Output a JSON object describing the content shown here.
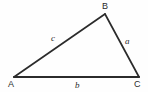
{
  "figure": {
    "type": "triangle-diagram",
    "background_color": "#fefefe",
    "stroke_color": "#2b2b2b",
    "text_color": "#2b2b2b",
    "vertices": [
      {
        "id": "A",
        "label": "A",
        "x": 14,
        "y": 77,
        "label_x": 8,
        "label_y": 80
      },
      {
        "id": "B",
        "label": "B",
        "x": 105,
        "y": 14,
        "label_x": 102,
        "label_y": 2
      },
      {
        "id": "C",
        "label": "C",
        "x": 139,
        "y": 77,
        "label_x": 134,
        "label_y": 80
      }
    ],
    "sides": [
      {
        "id": "a",
        "label": "a",
        "from": "B",
        "to": "C",
        "stroke_width": 1.6,
        "label_x": 125,
        "label_y": 37
      },
      {
        "id": "b",
        "label": "b",
        "from": "A",
        "to": "C",
        "stroke_width": 2.1,
        "label_x": 75,
        "label_y": 81
      },
      {
        "id": "c",
        "label": "c",
        "from": "A",
        "to": "B",
        "stroke_width": 1.6,
        "label_x": 51,
        "label_y": 34
      }
    ]
  }
}
